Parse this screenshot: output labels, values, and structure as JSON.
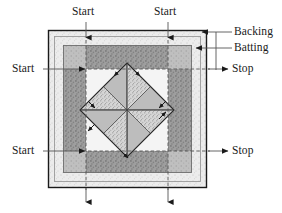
{
  "diagram": {
    "type": "quilt-layer-diagram"
  },
  "labels": {
    "start_top_left": "Start",
    "start_top_right": "Start",
    "start_mid_left": "Start",
    "start_bottom_left": "Start",
    "stop_mid_right": "Stop",
    "stop_bottom_right": "Stop",
    "backing": "Backing",
    "batting": "Batting"
  },
  "colors": {
    "outline": "#1a1a1a",
    "backing_fill": "#e8e8e8",
    "batting_fill": "#b5b5b5",
    "top_fill": "#f2f2f2",
    "band_dark": "#8f8f8f",
    "band_mid": "#a8a8a8",
    "triangle_light": "#bdbdbd",
    "triangle_speckle": "#cfcfcf",
    "leader_line": "#555555",
    "page_bg": "#ffffff"
  },
  "geometry": {
    "frame": {
      "x": 48,
      "y": 30,
      "w": 159,
      "h": 158
    },
    "backing_inset": 6,
    "batting": {
      "x": 63,
      "y": 45,
      "w": 129,
      "h": 128
    },
    "center": {
      "cx": 127,
      "cy": 110
    },
    "diamond_radius": 47,
    "guide_v_left_x": 86,
    "guide_v_right_x": 168,
    "guide_h_top_y": 69,
    "guide_h_bottom_y": 151
  },
  "icons": {
    "arrow_down": "arrow-down-icon",
    "arrow_right": "arrow-right-icon",
    "arrow_left": "arrow-left-icon",
    "direction_marker": "direction-arrow-icon"
  }
}
